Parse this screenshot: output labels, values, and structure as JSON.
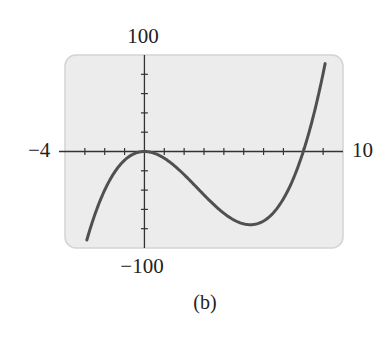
{
  "chart_data": {
    "type": "line",
    "title": "",
    "caption": "(b)",
    "xlabel": "",
    "ylabel": "",
    "xlim": [
      -4,
      10
    ],
    "ylim": [
      -100,
      100
    ],
    "x_tick_step": 1,
    "y_tick_step": 20,
    "grid": false,
    "legend": null,
    "window_labels": {
      "xmin": "−4",
      "xmax": "10",
      "ymin": "−100",
      "ymax": "100"
    },
    "series": [
      {
        "name": "y = x^3 - 8x^2",
        "x": [
          -2.9,
          -2,
          -1,
          0,
          1,
          2,
          3,
          4,
          5,
          5.33,
          6,
          7,
          8,
          9,
          9.1
        ],
        "y": [
          -91.7,
          -40,
          -9,
          0,
          -7,
          -24,
          -45,
          -64,
          -75,
          -75.9,
          -72,
          -49,
          0,
          81,
          100
        ]
      }
    ],
    "colors": {
      "background": "#ececec",
      "border": "#d3d3d3",
      "axis": "#333333",
      "curve": "#505050"
    }
  }
}
